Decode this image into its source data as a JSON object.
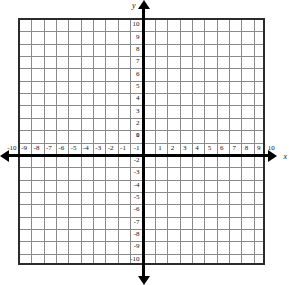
{
  "figure": {
    "type": "cartesian-coordinate-grid",
    "title": "",
    "background_color": "#ffffff",
    "grid_color": "#8a8a8a",
    "axis_color": "#000000",
    "border_color": "#2b2b2b"
  },
  "axes": {
    "x": {
      "name": "x",
      "min": -10,
      "max": 10,
      "step": 1,
      "tick_labels": [
        "-10",
        "-9",
        "-8",
        "-7",
        "-6",
        "-5",
        "-4",
        "-3",
        "-2",
        "-1",
        "1",
        "2",
        "3",
        "4",
        "5",
        "6",
        "7",
        "8",
        "9",
        "10"
      ],
      "tick_values": [
        -10,
        -9,
        -8,
        -7,
        -6,
        -5,
        -4,
        -3,
        -2,
        -1,
        1,
        2,
        3,
        4,
        5,
        6,
        7,
        8,
        9,
        10
      ],
      "arrow_start": true,
      "arrow_end": true
    },
    "y": {
      "name": "y",
      "min": -10,
      "max": 10,
      "step": 1,
      "tick_labels": [
        "10",
        "9",
        "8",
        "7",
        "6",
        "5",
        "4",
        "3",
        "2",
        "1",
        "-1",
        "-2",
        "-3",
        "-4",
        "-5",
        "-6",
        "-7",
        "-8",
        "-9",
        "-10"
      ],
      "tick_values": [
        10,
        9,
        8,
        7,
        6,
        5,
        4,
        3,
        2,
        1,
        -1,
        -2,
        -3,
        -4,
        -5,
        -6,
        -7,
        -8,
        -9,
        -10
      ],
      "arrow_start": true,
      "arrow_end": true
    },
    "origin_label": "0"
  },
  "chart_data": {
    "type": "scatter",
    "title": "",
    "xlabel": "x",
    "ylabel": "y",
    "xlim": [
      -10,
      10
    ],
    "ylim": [
      -10,
      10
    ],
    "grid": true,
    "legend": null,
    "series": [],
    "annotations": []
  }
}
